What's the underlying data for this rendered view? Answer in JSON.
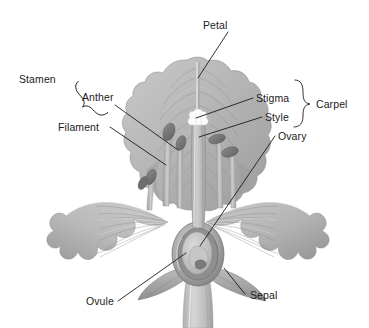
{
  "diagram": {
    "style": "grayscale botanical illustration",
    "background_color": "#ffffff",
    "line_color": "#1b1b1b",
    "labels": {
      "petal": "Petal",
      "stamen": "Stamen",
      "anther": "Anther",
      "filament": "Filament",
      "stigma": "Stigma",
      "style": "Style",
      "ovary": "Ovary",
      "carpel": "Carpel",
      "ovule": "Ovule",
      "sepal": "Sepal"
    },
    "groups": [
      {
        "name": "Stamen",
        "members": [
          "Anther",
          "Filament"
        ],
        "brace_side": "left"
      },
      {
        "name": "Carpel",
        "members": [
          "Stigma",
          "Style",
          "Ovary"
        ],
        "brace_side": "right"
      }
    ],
    "palette": {
      "petal_light": "#d2d2d2",
      "petal_mid": "#b4b4b4",
      "petal_dark": "#949494",
      "petal_shadow": "#7d7d7d",
      "anther_dark": "#767676",
      "ovary_wall": "#8d8d8d",
      "ovule_fill": "#c9c9c9",
      "stem": "#c6c6c6",
      "stigma_white": "#fbfbfb"
    }
  }
}
